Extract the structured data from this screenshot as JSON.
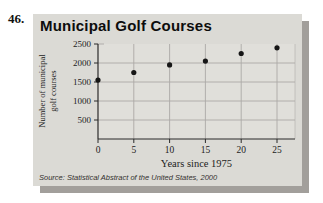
{
  "problem_number": "46.",
  "panel": {
    "source": "Source: Statistical Abstract of the United States, 2000"
  },
  "chart_data": {
    "type": "scatter",
    "title": "Municipal Golf Courses",
    "xlabel": "Years since 1975",
    "ylabel": "Number of municipal golf courses",
    "x": [
      0,
      5,
      10,
      15,
      20,
      25
    ],
    "y": [
      1550,
      1750,
      1950,
      2050,
      2250,
      2400
    ],
    "x_ticks": [
      0,
      5,
      10,
      15,
      20,
      25
    ],
    "y_ticks": [
      500,
      1000,
      1500,
      2000,
      2500
    ],
    "xlim": [
      0,
      27.5
    ],
    "ylim": [
      0,
      2500
    ],
    "grid": true,
    "legend": "none",
    "colors": {
      "point": "#161616",
      "grid": "#aba9a6",
      "axis": "#2b2b2b",
      "tick_text": "#1c1c1c"
    }
  },
  "colors": {
    "page_bg": "#ffffff",
    "panel_bg": "#dbdad5",
    "plot_bg": "#e0dfda",
    "panel_shadow": "#a29f9b"
  }
}
